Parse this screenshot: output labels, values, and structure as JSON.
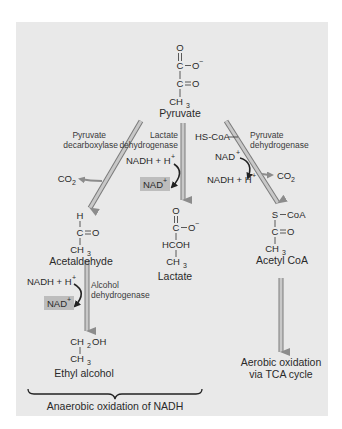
{
  "compounds": {
    "pyruvate": {
      "name": "Pyruvate",
      "structure": [
        "O",
        "C—O⁻",
        "C═O",
        "CH₃"
      ],
      "top_o": "O",
      "c1": "C",
      "o_minus": "O",
      "minus": "−",
      "c2": "C",
      "o2": "O",
      "ch3": "CH",
      "ch3_sub": "3"
    },
    "acetaldehyde": {
      "name": "Acetaldehyde",
      "h": "H",
      "c": "C",
      "o": "O",
      "ch3": "CH",
      "ch3_sub": "3"
    },
    "lactate": {
      "name": "Lactate",
      "top_o": "O",
      "c1": "C",
      "o_minus": "O",
      "minus": "−",
      "hcoh": "HCOH",
      "ch3": "CH",
      "ch3_sub": "3"
    },
    "acetyl_coa": {
      "name": "Acetyl CoA",
      "s": "S",
      "coa": "CoA",
      "c": "C",
      "o": "O",
      "ch3": "CH",
      "ch3_sub": "3"
    },
    "ethyl_alcohol": {
      "name": "Ethyl alcohol",
      "ch2oh_a": "CH",
      "ch2oh_sub": "2",
      "ch2oh_b": "OH",
      "ch3": "CH",
      "ch3_sub": "3"
    }
  },
  "enzymes": {
    "pyruvate_decarboxylase": [
      "Pyruvate",
      "decarboxylase"
    ],
    "lactate_dehydrogenase": [
      "Lactate",
      "dehydrogenase"
    ],
    "pyruvate_dehydrogenase": [
      "Pyruvate",
      "dehydrogenase"
    ],
    "alcohol_dehydrogenase": [
      "Alcohol",
      "dehydrogenase"
    ]
  },
  "cofactors": {
    "co2": "CO",
    "co2_sub": "2",
    "nadh_h": "NADH + H",
    "plus": "+",
    "nad": "NAD",
    "hs_coa": "HS-CoA"
  },
  "outcomes": {
    "aerobic": [
      "Aerobic oxidation",
      "via TCA cycle"
    ],
    "anaerobic": "Anaerobic oxidation of NADH"
  },
  "colors": {
    "panel": "#e9e9e9",
    "arrow_fill": "#b4b4b4",
    "arrow_edge": "#7a7a7a",
    "nad_highlight": "#bdbdbd",
    "text": "#2a2a2a"
  }
}
